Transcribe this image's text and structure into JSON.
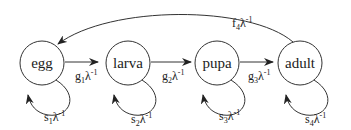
{
  "diagram": {
    "type": "life-cycle graph",
    "nodes": [
      {
        "id": "egg",
        "label": "egg"
      },
      {
        "id": "larva",
        "label": "larva"
      },
      {
        "id": "pupa",
        "label": "pupa"
      },
      {
        "id": "adult",
        "label": "adult"
      }
    ],
    "transitions": [
      {
        "from": "egg",
        "to": "larva",
        "sym": "g",
        "sub": "1",
        "lam": "λ",
        "exp": "-1"
      },
      {
        "from": "larva",
        "to": "pupa",
        "sym": "g",
        "sub": "2",
        "lam": "λ",
        "exp": "-1"
      },
      {
        "from": "pupa",
        "to": "adult",
        "sym": "g",
        "sub": "3",
        "lam": "λ",
        "exp": "-1"
      },
      {
        "from": "adult",
        "to": "egg",
        "sym": "f",
        "sub": "4",
        "lam": "λ",
        "exp": "-1"
      }
    ],
    "self_loops": [
      {
        "node": "egg",
        "sym": "s",
        "sub": "1",
        "lam": "λ",
        "exp": "-1"
      },
      {
        "node": "larva",
        "sym": "s",
        "sub": "2",
        "lam": "λ",
        "exp": "-1"
      },
      {
        "node": "pupa",
        "sym": "s",
        "sub": "3",
        "lam": "λ",
        "exp": "-1"
      },
      {
        "node": "adult",
        "sym": "s",
        "sub": "4",
        "lam": "λ",
        "exp": "-1"
      }
    ]
  }
}
